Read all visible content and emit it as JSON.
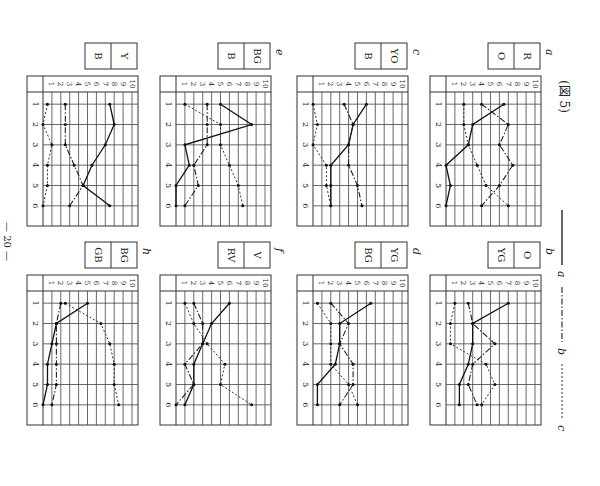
{
  "caption": {
    "text": "(図 5)"
  },
  "page_number": {
    "text": "— 20 —"
  },
  "legend": {
    "items": [
      {
        "key": "a",
        "label": "a",
        "style": "solid"
      },
      {
        "key": "b",
        "label": "b",
        "style": "dash-dot"
      },
      {
        "key": "c",
        "label": "c",
        "style": "dotted"
      }
    ]
  },
  "axis": {
    "x_ticks": [
      "1",
      "2",
      "3",
      "4",
      "5",
      "6"
    ],
    "y_ticks": [
      "1",
      "2",
      "3",
      "4",
      "5",
      "6",
      "7",
      "8",
      "9",
      "10"
    ]
  },
  "chart_data": [
    {
      "type": "line",
      "panel": "a",
      "title": "R / O",
      "labels": [
        "R",
        "O"
      ],
      "categories": [
        1,
        2,
        3,
        4,
        5,
        6
      ],
      "ylim": [
        0,
        10
      ],
      "grid": true,
      "series": [
        {
          "name": "a",
          "style": "solid",
          "values": [
            6.5,
            3,
            2.5,
            0,
            0.5,
            0
          ]
        },
        {
          "name": "b",
          "style": "dash-dot",
          "values": [
            4,
            7,
            6,
            7.5,
            6,
            4
          ]
        },
        {
          "name": "c",
          "style": "dotted",
          "values": [
            2,
            2,
            2.5,
            3.5,
            4.5,
            7
          ]
        }
      ]
    },
    {
      "type": "line",
      "panel": "b",
      "title": "O / YG",
      "labels": [
        "O",
        "YG"
      ],
      "categories": [
        1,
        2,
        3,
        4,
        5,
        6
      ],
      "ylim": [
        0,
        10
      ],
      "grid": true,
      "series": [
        {
          "name": "a",
          "style": "solid",
          "values": [
            7,
            3,
            3,
            2.5,
            1.5,
            1.5
          ]
        },
        {
          "name": "b",
          "style": "dash-dot",
          "values": [
            2.5,
            3,
            5.5,
            3,
            2.5,
            3.5
          ]
        },
        {
          "name": "c",
          "style": "dotted",
          "values": [
            1,
            0.5,
            0.5,
            4.5,
            5.5,
            4
          ]
        }
      ]
    },
    {
      "type": "line",
      "panel": "c",
      "title": "YO / B",
      "labels": [
        "YO",
        "B"
      ],
      "categories": [
        1,
        2,
        3,
        4,
        5,
        6
      ],
      "ylim": [
        0,
        10
      ],
      "grid": true,
      "series": [
        {
          "name": "a",
          "style": "solid",
          "values": [
            6,
            4.5,
            4,
            2,
            2,
            2
          ]
        },
        {
          "name": "b",
          "style": "dash-dot",
          "values": [
            3.5,
            4.5,
            4,
            4,
            5,
            5.5
          ]
        },
        {
          "name": "c",
          "style": "dotted",
          "values": [
            0,
            0.5,
            0,
            1.5,
            1.5,
            2
          ]
        }
      ]
    },
    {
      "type": "line",
      "panel": "d",
      "title": "YG / BG",
      "labels": [
        "YG",
        "BG"
      ],
      "categories": [
        1,
        2,
        3,
        4,
        5,
        6
      ],
      "ylim": [
        0,
        10
      ],
      "grid": true,
      "series": [
        {
          "name": "a",
          "style": "solid",
          "values": [
            6.5,
            3,
            3,
            2.5,
            0.5,
            0.5
          ]
        },
        {
          "name": "b",
          "style": "dash-dot",
          "values": [
            2,
            4,
            3,
            4.5,
            4.5,
            3
          ]
        },
        {
          "name": "c",
          "style": "dotted",
          "values": [
            0.5,
            2,
            2,
            2,
            4,
            5
          ]
        }
      ]
    },
    {
      "type": "line",
      "panel": "e",
      "title": "BG / B",
      "labels": [
        "BG",
        "B"
      ],
      "categories": [
        1,
        2,
        3,
        4,
        5,
        6
      ],
      "ylim": [
        0,
        10
      ],
      "grid": true,
      "series": [
        {
          "name": "a",
          "style": "solid",
          "values": [
            5,
            8.5,
            1,
            1.5,
            0,
            0
          ]
        },
        {
          "name": "b",
          "style": "dash-dot",
          "values": [
            3.5,
            3.5,
            3.5,
            2,
            2.5,
            1
          ]
        },
        {
          "name": "c",
          "style": "dotted",
          "values": [
            1,
            5,
            5,
            6,
            7,
            7.5
          ]
        }
      ]
    },
    {
      "type": "line",
      "panel": "f",
      "title": "V / RV",
      "labels": [
        "V",
        "RV"
      ],
      "categories": [
        1,
        2,
        3,
        4,
        5,
        6
      ],
      "ylim": [
        0,
        10
      ],
      "grid": true,
      "series": [
        {
          "name": "a",
          "style": "solid",
          "values": [
            6,
            4,
            3,
            2,
            2,
            1
          ]
        },
        {
          "name": "b",
          "style": "dash-dot",
          "values": [
            2,
            3,
            3,
            1,
            2,
            0
          ]
        },
        {
          "name": "c",
          "style": "dotted",
          "values": [
            1,
            2,
            3.5,
            5.5,
            5,
            8.5
          ]
        }
      ]
    },
    {
      "type": "line",
      "panel": "g",
      "title": "Y / B",
      "labels": [
        "Y",
        "B"
      ],
      "categories": [
        1,
        2,
        3,
        4,
        5,
        6
      ],
      "ylim": [
        0,
        10
      ],
      "grid": true,
      "series": [
        {
          "name": "a",
          "style": "solid",
          "values": [
            7.5,
            8,
            7,
            5.5,
            4.5,
            7.5
          ]
        },
        {
          "name": "b",
          "style": "dash-dot",
          "values": [
            2.5,
            2.5,
            2.5,
            3.5,
            4.5,
            3
          ]
        },
        {
          "name": "c",
          "style": "dotted",
          "values": [
            0.5,
            0,
            1,
            0.5,
            0.5,
            0
          ]
        }
      ]
    },
    {
      "type": "line",
      "panel": "h",
      "title": "BG / GB",
      "labels": [
        "BG",
        "GB"
      ],
      "categories": [
        1,
        2,
        3,
        4,
        5,
        6
      ],
      "ylim": [
        0,
        10
      ],
      "grid": true,
      "series": [
        {
          "name": "a",
          "style": "solid",
          "values": [
            5,
            1.5,
            1,
            0.5,
            0.5,
            0
          ]
        },
        {
          "name": "b",
          "style": "dash-dot",
          "values": [
            2,
            1.5,
            1.5,
            1.5,
            1.5,
            1
          ]
        },
        {
          "name": "c",
          "style": "dotted",
          "values": [
            2.5,
            6.5,
            7.5,
            8,
            8,
            8.5
          ]
        }
      ]
    }
  ],
  "layout": {
    "panels": [
      {
        "panel": "g",
        "x": 27,
        "y": 76,
        "letter": ""
      },
      {
        "panel": "e",
        "x": 160,
        "y": 76,
        "letter": "e"
      },
      {
        "panel": "c",
        "x": 297,
        "y": 76,
        "letter": "c"
      },
      {
        "panel": "a",
        "x": 430,
        "y": 76,
        "letter": "a"
      },
      {
        "panel": "h",
        "x": 27,
        "y": 275,
        "letter": "h"
      },
      {
        "panel": "f",
        "x": 160,
        "y": 275,
        "letter": "f"
      },
      {
        "panel": "d",
        "x": 297,
        "y": 275,
        "letter": "d"
      },
      {
        "panel": "b",
        "x": 430,
        "y": 275,
        "letter": "b"
      }
    ]
  }
}
